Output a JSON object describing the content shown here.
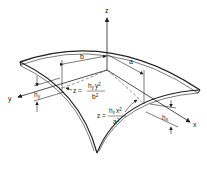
{
  "diagram": {
    "type": "doubly-curved shell surface geometry",
    "axes": {
      "x": "x",
      "y": "y",
      "z": "z"
    },
    "dimensions": {
      "a": "a",
      "b": "b",
      "hx": "h",
      "hx_sub": "x",
      "hy": "h",
      "hy_sub": "y"
    },
    "equations": {
      "y_curve": {
        "lhs": "z =",
        "num": "h",
        "num_sub": "y",
        "num_var": "y",
        "num_exp": "2",
        "den": "b",
        "den_exp": "2"
      },
      "x_curve": {
        "lhs": "z =",
        "num": "h",
        "num_sub": "x",
        "num_var": "x",
        "num_exp": "2",
        "den": "a",
        "den_exp": "2"
      }
    },
    "colors": {
      "line": "#222222",
      "background": "#ffffff"
    }
  }
}
